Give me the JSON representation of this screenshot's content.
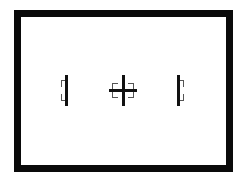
{
  "diagram": {
    "frame": {
      "color": "#0a0a0a",
      "background": "#ffffff"
    },
    "markers": [
      {
        "name": "left-marker",
        "type": "vertical-bracket"
      },
      {
        "name": "center-marker",
        "type": "crosshair-bracket"
      },
      {
        "name": "right-marker",
        "type": "vertical-bracket"
      }
    ]
  }
}
